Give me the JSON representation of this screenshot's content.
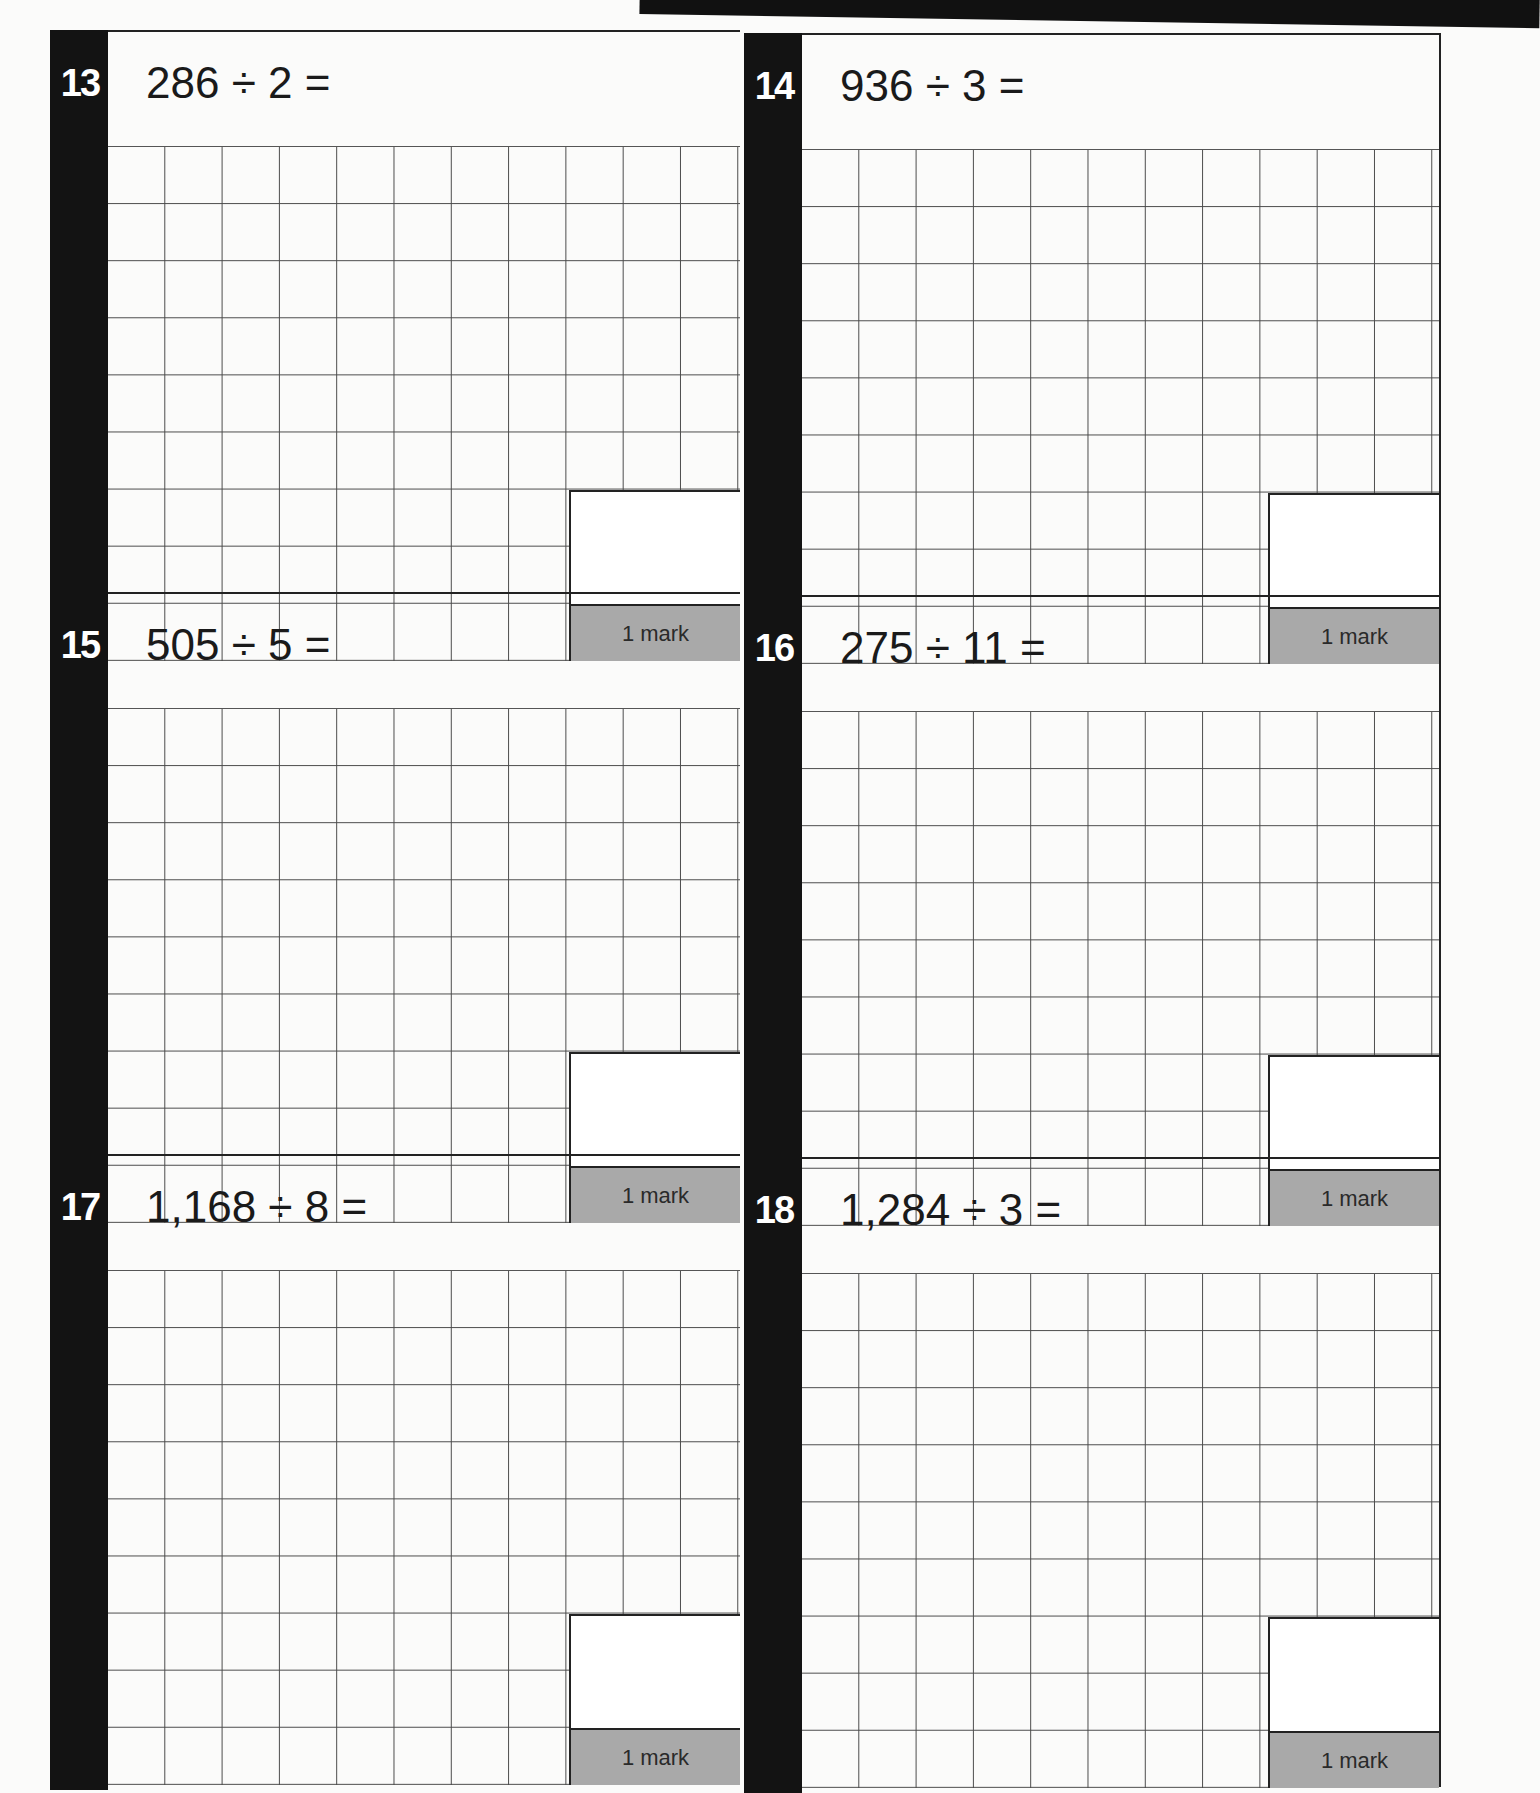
{
  "page": {
    "background": "#fbfbfa",
    "bar_color": "#131313",
    "mark_color": "#a9a9a9"
  },
  "questions": [
    {
      "number": "13",
      "expression": "286 ÷ 2 =",
      "marks": "1 mark"
    },
    {
      "number": "14",
      "expression": "936 ÷ 3 =",
      "marks": "1 mark"
    },
    {
      "number": "15",
      "expression": "505 ÷ 5 =",
      "marks": "1 mark"
    },
    {
      "number": "16",
      "expression": "275 ÷ 11 =",
      "marks": "1 mark"
    },
    {
      "number": "17",
      "expression": "1,168 ÷ 8 =",
      "marks": "1 mark"
    },
    {
      "number": "18",
      "expression": "1,284 ÷ 3 =",
      "marks": "1 mark"
    }
  ]
}
